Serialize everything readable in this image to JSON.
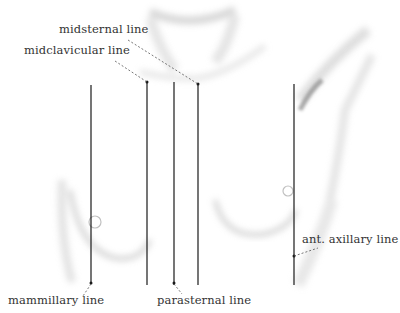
{
  "figure": {
    "type": "anatomical-illustration",
    "labels": {
      "midsternal": "midsternal line",
      "midclavicular": "midclavicular line",
      "mammillary": "mammillary line",
      "parasternal": "parasternal line",
      "ant_axillary": "ant. axillary line"
    },
    "colors": {
      "line": "#1a1a1a",
      "label": "#333333",
      "shading": "#bdbdbd",
      "background": "#ffffff"
    }
  }
}
